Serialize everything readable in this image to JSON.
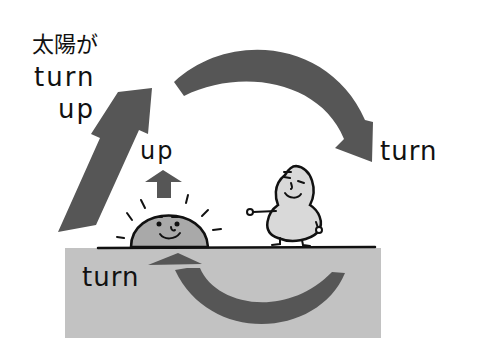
{
  "labels": {
    "sun_title_line1": "太陽が",
    "sun_title_line2": "turn",
    "sun_title_line3": "up",
    "up_small": "up",
    "turn_right": "turn",
    "turn_ground": "turn"
  },
  "colors": {
    "arrow": "#565656",
    "ground": "#c2c2c2",
    "sun_fill": "#a9a9a9",
    "character_fill": "#d9d9d9",
    "ink": "#111111",
    "background": "#ffffff"
  }
}
